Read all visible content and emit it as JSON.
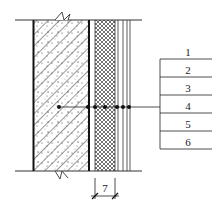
{
  "diagram": {
    "type": "wall-section-detail",
    "callouts": [
      {
        "num": "1",
        "y": 55
      },
      {
        "num": "2",
        "y": 73
      },
      {
        "num": "3",
        "y": 91
      },
      {
        "num": "4",
        "y": 109
      },
      {
        "num": "5",
        "y": 127
      },
      {
        "num": "6",
        "y": 145
      }
    ],
    "dimension_label": "7",
    "colors": {
      "line": "#222222",
      "background": "#ffffff"
    }
  }
}
